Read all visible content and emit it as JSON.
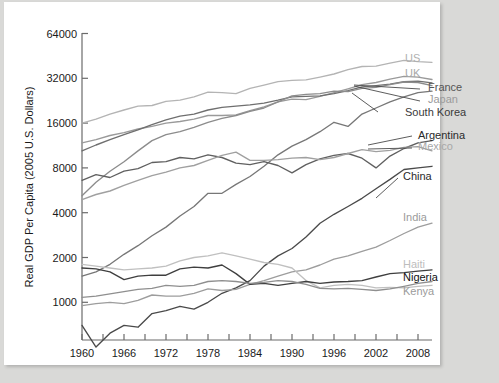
{
  "figure": {
    "background": "#ffffff",
    "page_background": "#d9d9d7"
  },
  "chart_data": {
    "type": "line",
    "title": "",
    "xlabel": "",
    "ylabel": "Real GDP Per Capita (2005 U.S. Dollars)",
    "yscale": "log",
    "ylim": [
      800,
      64000
    ],
    "xlim": [
      1960,
      2010
    ],
    "grid": false,
    "legend_position": "right-inline-labels",
    "ytick_labels": [
      "1000",
      "2000",
      "4000",
      "8000",
      "16000",
      "32000",
      "64000"
    ],
    "ytick_values": [
      1000,
      2000,
      4000,
      8000,
      16000,
      32000,
      64000
    ],
    "xtick_labels": [
      "1960",
      "1966",
      "1972",
      "1978",
      "1984",
      "1990",
      "1996",
      "2002",
      "2008"
    ],
    "xtick_values": [
      1960,
      1966,
      1972,
      1978,
      1984,
      1990,
      1996,
      2002,
      2008
    ],
    "x": [
      1960,
      1962,
      1964,
      1966,
      1968,
      1970,
      1972,
      1974,
      1976,
      1978,
      1980,
      1982,
      1984,
      1986,
      1988,
      1990,
      1992,
      1994,
      1996,
      1998,
      2000,
      2002,
      2004,
      2006,
      2008,
      2010
    ],
    "series": [
      {
        "name": "US",
        "color": "#b4b4b4",
        "label_color": "#b0b0b0",
        "values": [
          16000,
          17000,
          18400,
          19600,
          20800,
          21000,
          22400,
          22800,
          24000,
          25800,
          25600,
          25200,
          27400,
          28800,
          30400,
          31000,
          31200,
          32600,
          34200,
          36600,
          38400,
          38600,
          40400,
          42200,
          41400,
          41000
        ]
      },
      {
        "name": "UK",
        "color": "#9a9a9a",
        "label_color": "#a8a8a8",
        "values": [
          11800,
          12400,
          13200,
          13800,
          14600,
          15200,
          16000,
          16400,
          17000,
          18000,
          18000,
          18200,
          19400,
          20600,
          22200,
          23200,
          23000,
          24200,
          25600,
          27200,
          29000,
          30000,
          31600,
          33000,
          32600,
          31400
        ]
      },
      {
        "name": "France",
        "color": "#6f6f6f",
        "label_color": "#555555",
        "values": [
          10400,
          11400,
          12400,
          13400,
          14400,
          15600,
          16800,
          17800,
          18400,
          19600,
          20400,
          20800,
          21200,
          21800,
          22800,
          24000,
          24200,
          24400,
          25200,
          26400,
          28000,
          28600,
          29200,
          30400,
          30600,
          29800
        ]
      },
      {
        "name": "Japan",
        "color": "#8c8c8c",
        "label_color": "#9b9b9b",
        "values": [
          5200,
          6400,
          7600,
          8800,
          10400,
          12200,
          13400,
          14000,
          15000,
          16200,
          17200,
          18000,
          19200,
          20200,
          22200,
          24400,
          25000,
          25200,
          26200,
          26000,
          27400,
          27800,
          29000,
          30200,
          30000,
          28600
        ]
      },
      {
        "name": "South Korea",
        "color": "#777777",
        "label_color": "#3a3a3a",
        "values": [
          1500,
          1600,
          1800,
          2100,
          2400,
          2800,
          3200,
          3800,
          4400,
          5400,
          5400,
          6200,
          7000,
          8200,
          9800,
          11200,
          12400,
          14000,
          16200,
          15200,
          18400,
          20200,
          22200,
          24000,
          25600,
          26200
        ]
      },
      {
        "name": "Argentina",
        "color": "#606060",
        "label_color": "#2a2a2a",
        "values": [
          6600,
          7200,
          6900,
          7600,
          7900,
          8700,
          8800,
          9400,
          9200,
          9800,
          9400,
          8600,
          8400,
          8800,
          8300,
          7400,
          8400,
          9200,
          9700,
          10000,
          9300,
          8000,
          9600,
          10800,
          11800,
          12200
        ]
      },
      {
        "name": "Mexico",
        "color": "#a0a0a0",
        "label_color": "#a8a8a8",
        "values": [
          4900,
          5300,
          5600,
          6100,
          6600,
          7100,
          7500,
          8000,
          8300,
          9000,
          9700,
          10200,
          9000,
          9000,
          9100,
          9300,
          9400,
          9100,
          9400,
          10000,
          10600,
          10300,
          10500,
          11000,
          11100,
          10400
        ]
      },
      {
        "name": "China",
        "color": "#4a4a4a",
        "label_color": "#2a2a2a",
        "values": [
          700,
          500,
          620,
          700,
          680,
          840,
          880,
          940,
          900,
          1000,
          1150,
          1250,
          1400,
          1750,
          2050,
          2300,
          2750,
          3400,
          3900,
          4400,
          5000,
          5800,
          6700,
          7800,
          8000,
          8200
        ]
      },
      {
        "name": "India",
        "color": "#9d9d9d",
        "label_color": "#9b9b9b",
        "values": [
          950,
          980,
          1000,
          980,
          1030,
          1120,
          1100,
          1100,
          1150,
          1230,
          1200,
          1220,
          1320,
          1400,
          1500,
          1600,
          1650,
          1780,
          1950,
          2050,
          2200,
          2350,
          2600,
          2900,
          3200,
          3400
        ]
      },
      {
        "name": "Haiti",
        "color": "#c0c0c0",
        "label_color": "#bdbdbd",
        "values": [
          1800,
          1750,
          1700,
          1650,
          1680,
          1700,
          1750,
          1900,
          2000,
          2050,
          2150,
          2050,
          1950,
          1850,
          1800,
          1700,
          1400,
          1250,
          1300,
          1320,
          1300,
          1250,
          1260,
          1250,
          1280,
          1300
        ]
      },
      {
        "name": "Nigeria",
        "color": "#3f3f3f",
        "label_color": "#111111",
        "values": [
          1700,
          1680,
          1600,
          1420,
          1500,
          1520,
          1520,
          1680,
          1720,
          1700,
          1780,
          1560,
          1320,
          1340,
          1300,
          1340,
          1380,
          1340,
          1370,
          1380,
          1400,
          1480,
          1560,
          1580,
          1620,
          1650
        ]
      },
      {
        "name": "Kenya",
        "color": "#8f8f8f",
        "label_color": "#9b9b9b",
        "values": [
          1080,
          1100,
          1140,
          1180,
          1220,
          1240,
          1300,
          1280,
          1300,
          1380,
          1400,
          1380,
          1340,
          1360,
          1400,
          1380,
          1320,
          1240,
          1230,
          1240,
          1220,
          1200,
          1230,
          1280,
          1340,
          1380
        ]
      }
    ],
    "annotations": [
      {
        "label": "US",
        "x": 405,
        "y": 62
      },
      {
        "label": "UK",
        "x": 405,
        "y": 77
      },
      {
        "label": "France",
        "x": 428,
        "y": 91
      },
      {
        "label": "Japan",
        "x": 428,
        "y": 103
      },
      {
        "label": "South Korea",
        "x": 405,
        "y": 116
      },
      {
        "label": "Argentina",
        "x": 418,
        "y": 139
      },
      {
        "label": "Mexico",
        "x": 418,
        "y": 150
      },
      {
        "label": "China",
        "x": 403,
        "y": 180
      },
      {
        "label": "India",
        "x": 403,
        "y": 221
      },
      {
        "label": "Haiti",
        "x": 403,
        "y": 268
      },
      {
        "label": "Nigeria",
        "x": 403,
        "y": 281
      },
      {
        "label": "Kenya",
        "x": 403,
        "y": 295
      }
    ]
  }
}
